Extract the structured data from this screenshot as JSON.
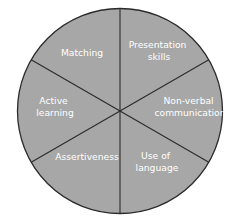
{
  "diagram": {
    "type": "wheel",
    "fill_color": "#a7a7a7",
    "line_color": "#2b2b2b",
    "text_color": "#ffffff",
    "segments": [
      {
        "id": "matching",
        "lines": [
          "Matching"
        ]
      },
      {
        "id": "presentation-skills",
        "lines": [
          "Presentation",
          "skills"
        ]
      },
      {
        "id": "non-verbal-communication",
        "lines": [
          "Non-verbal",
          "communication"
        ]
      },
      {
        "id": "use-of-language",
        "lines": [
          "Use of",
          "language"
        ]
      },
      {
        "id": "assertiveness",
        "lines": [
          "Assertiveness"
        ]
      },
      {
        "id": "active-learning",
        "lines": [
          "Active",
          "learning"
        ]
      }
    ]
  }
}
